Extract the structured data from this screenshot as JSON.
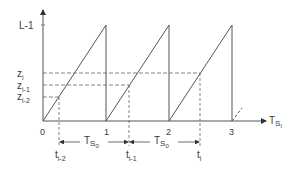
{
  "diagram": {
    "type": "sawtooth-timing-diagram",
    "y_axis": {
      "top_label": "L-1",
      "levels": [
        {
          "name": "z",
          "sub": "i"
        },
        {
          "name": "z",
          "sub": "i-1"
        },
        {
          "name": "z",
          "sub": "i-2"
        }
      ]
    },
    "x_axis": {
      "label": "T",
      "label_sub": "S",
      "label_subsub": "I",
      "ticks": [
        "0",
        "1",
        "2",
        "3"
      ]
    },
    "time_markers": [
      {
        "name": "t",
        "sub": "i-2"
      },
      {
        "name": "t",
        "sub": "i-1"
      },
      {
        "name": "t",
        "sub": "i"
      }
    ],
    "intervals": [
      {
        "label": "T",
        "sub": "S",
        "subsub": "0"
      },
      {
        "label": "T",
        "sub": "S",
        "subsub": "0"
      }
    ],
    "colors": {
      "line": "#4a4a4a",
      "text": "#3a3a3a"
    }
  }
}
